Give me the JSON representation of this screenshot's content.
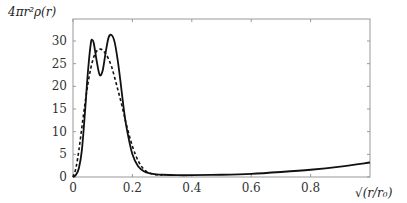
{
  "chart_data": {
    "type": "line",
    "title": "",
    "ylabel": "4πr²ρ(r)",
    "xlabel": "√(r/r₀)",
    "xlim": [
      0,
      1
    ],
    "ylim": [
      0,
      32
    ],
    "xticks": [
      "0",
      "0.2",
      "0.4",
      "0.6",
      "0.8"
    ],
    "xtick_values": [
      0,
      0.2,
      0.4,
      0.6,
      0.8
    ],
    "yticks": [
      "0",
      "5",
      "10",
      "15",
      "20",
      "25",
      "30"
    ],
    "ytick_values": [
      0,
      5,
      10,
      15,
      20,
      25,
      30
    ],
    "grid": false,
    "series": [
      {
        "name": "solid",
        "style": "solid",
        "x": [
          0,
          0.01,
          0.02,
          0.03,
          0.04,
          0.05,
          0.06,
          0.065,
          0.07,
          0.08,
          0.09,
          0.1,
          0.11,
          0.12,
          0.13,
          0.14,
          0.15,
          0.16,
          0.17,
          0.18,
          0.2,
          0.22,
          0.24,
          0.26,
          0.28,
          0.3,
          0.35,
          0.4,
          0.5,
          0.6,
          0.7,
          0.8,
          0.9,
          1.0
        ],
        "y": [
          0,
          0.5,
          2,
          6,
          14,
          23,
          29.5,
          30.2,
          29.5,
          25.5,
          22.5,
          23.5,
          27.5,
          30.8,
          31.3,
          29.8,
          26,
          21,
          15.5,
          11,
          5,
          2.3,
          1.2,
          0.8,
          0.6,
          0.5,
          0.4,
          0.4,
          0.5,
          0.7,
          1.1,
          1.6,
          2.3,
          3.2
        ]
      },
      {
        "name": "dashed",
        "style": "dashed",
        "x": [
          0,
          0.01,
          0.02,
          0.03,
          0.04,
          0.05,
          0.06,
          0.07,
          0.08,
          0.09,
          0.1,
          0.11,
          0.12,
          0.13,
          0.14,
          0.15,
          0.16,
          0.17,
          0.18,
          0.2,
          0.22,
          0.24,
          0.26,
          0.28,
          0.3
        ],
        "y": [
          0,
          2,
          6,
          11,
          16,
          20.5,
          24,
          26.5,
          27.8,
          28.2,
          28,
          27.2,
          26,
          24.3,
          22,
          19.5,
          17,
          14.3,
          11.5,
          6.8,
          3.5,
          1.6,
          0.8,
          0.5,
          0.4
        ]
      }
    ]
  }
}
